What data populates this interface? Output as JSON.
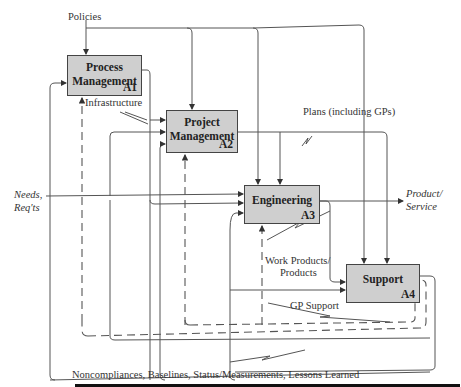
{
  "diagram": {
    "type": "IDEF0 process diagram",
    "boxes": [
      {
        "id": "A1",
        "title": "Process Management",
        "code": "A1"
      },
      {
        "id": "A2",
        "title": "Project Management",
        "code": "A2"
      },
      {
        "id": "A3",
        "title": "Engineering",
        "code": "A3"
      },
      {
        "id": "A4",
        "title": "Support",
        "code": "A4"
      }
    ],
    "labels": {
      "policies": "Policies",
      "infrastructure": "Infrastructure",
      "plans": "Plans (including GPs)",
      "needs": "Needs,",
      "reqts": "Req'ts",
      "product": "Product/",
      "service": "Service",
      "work_products": "Work Products/",
      "products": "Products",
      "gp_support": "GP Support",
      "feedback": "Noncompliances, Baselines, Status/Measurements, Lessons Learned"
    },
    "colors": {
      "box_fill": "#cfcfcf",
      "line": "#444444"
    }
  }
}
